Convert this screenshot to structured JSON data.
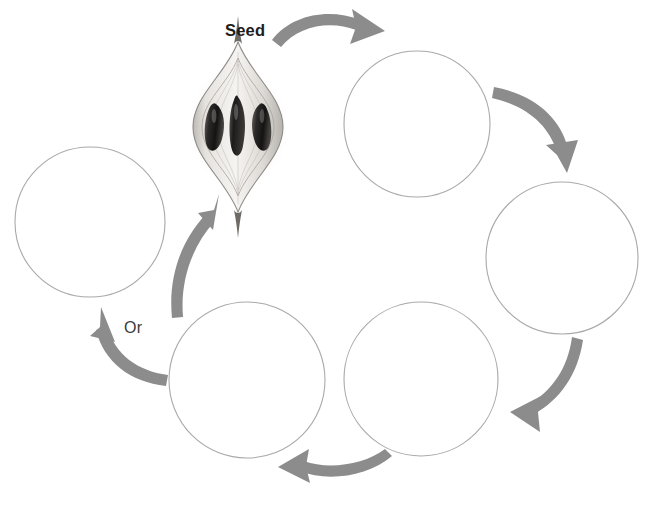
{
  "canvas": {
    "width": 649,
    "height": 515,
    "background_color": "#ffffff"
  },
  "palette": {
    "arrow_color": "#8c8c8c",
    "circle_stroke_color": "#a9a9a9",
    "seed_label_color": "#1d1d1d",
    "or_label_color": "#3a3a3a",
    "seed_dark": "#2b2b2b",
    "seed_pod_light": "#e8e6e3"
  },
  "labels": {
    "seed": "Seed",
    "or": "Or"
  },
  "illustration": {
    "name": "seed-pod-cross-section",
    "description": "Pencil-shaded seed pod cross-section with three dark seeds",
    "seed_count": 3,
    "center_x": 238,
    "center_y": 127,
    "width": 96,
    "height": 155
  },
  "circles": [
    {
      "id": "stage-1",
      "label": "",
      "cx": 417,
      "cy": 124,
      "r": 73
    },
    {
      "id": "stage-2",
      "label": "",
      "cx": 562,
      "cy": 258,
      "r": 76
    },
    {
      "id": "stage-3",
      "label": "",
      "cx": 421,
      "cy": 379,
      "r": 77
    },
    {
      "id": "stage-4",
      "label": "",
      "cx": 247,
      "cy": 380,
      "r": 78
    },
    {
      "id": "stage-5",
      "label": "",
      "cx": 90,
      "cy": 222,
      "r": 75
    }
  ],
  "arrows": [
    {
      "id": "arrow-seed-to-1",
      "from": "seed",
      "to": "stage-1",
      "direction": "clockwise-top"
    },
    {
      "id": "arrow-1-to-2",
      "from": "stage-1",
      "to": "stage-2",
      "direction": "down-right"
    },
    {
      "id": "arrow-2-to-3",
      "from": "stage-2",
      "to": "stage-3",
      "direction": "down-left"
    },
    {
      "id": "arrow-3-to-4",
      "from": "stage-3",
      "to": "stage-4",
      "direction": "left"
    },
    {
      "id": "arrow-4-to-5",
      "from": "stage-4",
      "to": "stage-5",
      "direction": "up-left"
    },
    {
      "id": "arrow-4-to-seed",
      "from": "stage-4",
      "to": "seed",
      "direction": "up-right"
    }
  ]
}
